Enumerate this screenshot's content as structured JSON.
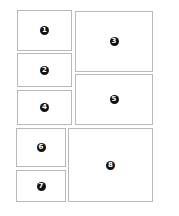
{
  "diagram": {
    "title": "",
    "panels": [
      {
        "label": "1",
        "x": 17,
        "y": 10,
        "w": 55,
        "h": 41
      },
      {
        "label": "2",
        "x": 17,
        "y": 53,
        "w": 55,
        "h": 34
      },
      {
        "label": "3",
        "x": 75,
        "y": 11,
        "w": 78,
        "h": 61
      },
      {
        "label": "4",
        "x": 17,
        "y": 90,
        "w": 55,
        "h": 35
      },
      {
        "label": "5",
        "x": 75,
        "y": 74,
        "w": 78,
        "h": 51
      },
      {
        "label": "6",
        "x": 16,
        "y": 128,
        "w": 50,
        "h": 39
      },
      {
        "label": "7",
        "x": 16,
        "y": 170,
        "w": 50,
        "h": 32
      },
      {
        "label": "8",
        "x": 68,
        "y": 128,
        "w": 85,
        "h": 74
      }
    ],
    "colors": {
      "border": "#b8b8b8",
      "badge_fill": "#111111",
      "badge_text": "#ffffff",
      "background": "#ffffff"
    }
  }
}
